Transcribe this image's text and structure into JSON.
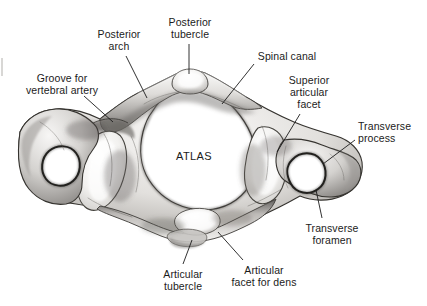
{
  "figure": {
    "center_label": "ATLAS",
    "background_color": "#ffffff",
    "bone_fill_light": "#f2f1ef",
    "bone_fill_mid": "#c9c7c4",
    "bone_fill_dark": "#6e6c6a",
    "outline_color": "#2a2a2a",
    "leader_line_color": "#1b1b1b",
    "text_color": "#1b1b1b"
  },
  "labels": [
    {
      "id": "groove-for-vertebral-artery",
      "text": "Groove for\nvertebral artery",
      "align": "center",
      "x": 12,
      "y": 72,
      "width": 100
    },
    {
      "id": "posterior-arch",
      "text": "Posterior\narch",
      "align": "center",
      "x": 88,
      "y": 28,
      "width": 62
    },
    {
      "id": "posterior-tubercle",
      "text": "Posterior\ntubercle",
      "align": "center",
      "x": 158,
      "y": 16,
      "width": 64
    },
    {
      "id": "spinal-canal",
      "text": "Spinal canal",
      "align": "center",
      "x": 252,
      "y": 50,
      "width": 70
    },
    {
      "id": "superior-articular-facet",
      "text": "Superior\narticular\nfacet",
      "align": "center",
      "x": 278,
      "y": 74,
      "width": 62
    },
    {
      "id": "transverse-process",
      "text": "Transverse\nprocess",
      "align": "left",
      "x": 358,
      "y": 120,
      "width": 68
    },
    {
      "id": "transverse-foramen",
      "text": "Transverse\nforamen",
      "align": "center",
      "x": 298,
      "y": 222,
      "width": 68
    },
    {
      "id": "articular-facet-for-dens",
      "text": "Articular\nfacet for dens",
      "align": "center",
      "x": 222,
      "y": 264,
      "width": 84
    },
    {
      "id": "articular-tubercle",
      "text": "Articular\ntubercle",
      "align": "center",
      "x": 148,
      "y": 268,
      "width": 70
    }
  ],
  "leader_lines": [
    {
      "id": "leader-groove-for-vertebral-artery",
      "x1": 84,
      "y1": 96,
      "x2": 113,
      "y2": 122
    },
    {
      "id": "leader-posterior-arch",
      "x1": 126,
      "y1": 56,
      "x2": 147,
      "y2": 98
    },
    {
      "id": "leader-posterior-tubercle",
      "x1": 189,
      "y1": 44,
      "x2": 189,
      "y2": 74
    },
    {
      "id": "leader-spinal-canal",
      "x1": 254,
      "y1": 64,
      "x2": 222,
      "y2": 104
    },
    {
      "id": "leader-superior-articular-facet",
      "x1": 300,
      "y1": 114,
      "x2": 277,
      "y2": 152
    },
    {
      "id": "leader-transverse-process",
      "x1": 355,
      "y1": 140,
      "x2": 323,
      "y2": 164
    },
    {
      "id": "leader-transverse-foramen",
      "x1": 322,
      "y1": 218,
      "x2": 316,
      "y2": 190
    },
    {
      "id": "leader-articular-facet-for-dens",
      "x1": 243,
      "y1": 260,
      "x2": 218,
      "y2": 232
    },
    {
      "id": "leader-articular-tubercle",
      "x1": 183,
      "y1": 264,
      "x2": 192,
      "y2": 240
    }
  ],
  "anatomy_parts": [
    {
      "id": "posterior-arch",
      "name": "Posterior arch"
    },
    {
      "id": "posterior-tubercle",
      "name": "Posterior tubercle"
    },
    {
      "id": "spinal-canal",
      "name": "Spinal canal"
    },
    {
      "id": "superior-articular-facet-left",
      "name": "Superior articular facet (left)"
    },
    {
      "id": "superior-articular-facet-right",
      "name": "Superior articular facet (right)"
    },
    {
      "id": "groove-for-vertebral-artery",
      "name": "Groove for vertebral artery"
    },
    {
      "id": "transverse-process-left",
      "name": "Transverse process (left)"
    },
    {
      "id": "transverse-process-right",
      "name": "Transverse process (right)"
    },
    {
      "id": "transverse-foramen-left",
      "name": "Transverse foramen (left)"
    },
    {
      "id": "transverse-foramen-right",
      "name": "Transverse foramen (right)"
    },
    {
      "id": "articular-facet-for-dens",
      "name": "Articular facet for dens"
    },
    {
      "id": "articular-tubercle",
      "name": "Articular tubercle"
    }
  ]
}
